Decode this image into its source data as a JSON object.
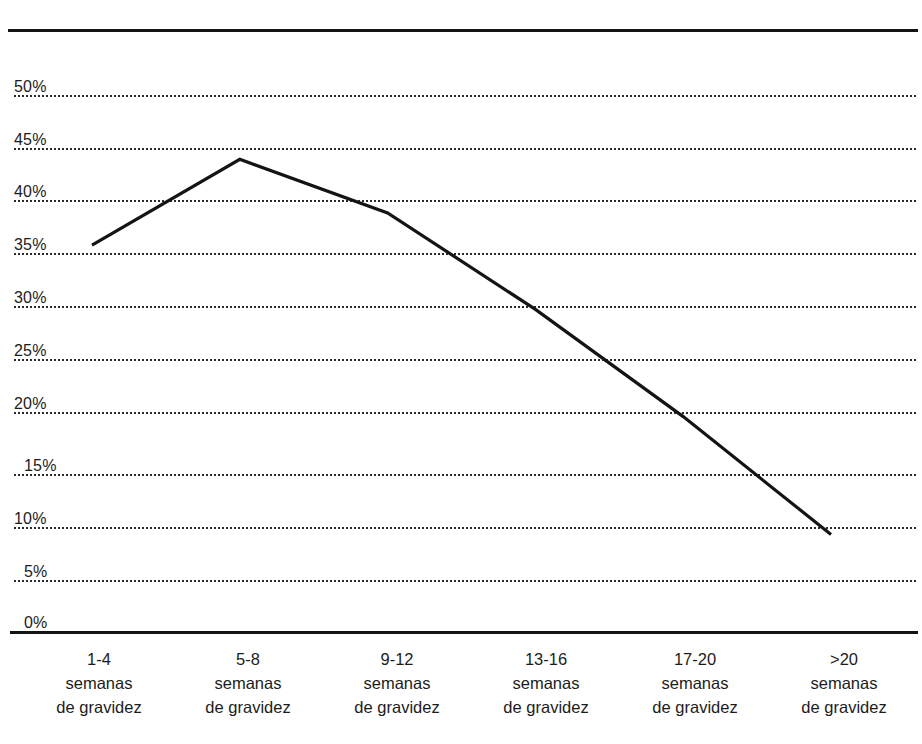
{
  "chart_data": {
    "type": "line",
    "title": "",
    "subtitle": "",
    "xlabel": "",
    "ylabel": "",
    "categories": [
      "1-4 semanas de gravidez",
      "5-8 semanas de gravidez",
      "9-12 semanas de gravidez",
      "13-16 semanas de gravidez",
      "17-20 semanas de gravidez",
      ">20 semanas de gravidez"
    ],
    "category_parts": [
      {
        "range": "1-4",
        "word1": "semanas",
        "word2": "de gravidez"
      },
      {
        "range": "5-8",
        "word1": "semanas",
        "word2": "de gravidez"
      },
      {
        "range": "9-12",
        "word1": "semanas",
        "word2": "de gravidez"
      },
      {
        "range": "13-16",
        "word1": "semanas",
        "word2": "de gravidez"
      },
      {
        "range": "17-20",
        "word1": "semanas",
        "word2": "de gravidez"
      },
      {
        "range": ">20",
        "word1": "semanas",
        "word2": "de gravidez"
      }
    ],
    "values": [
      36,
      44,
      39,
      30,
      20,
      9
    ],
    "value_labels": [
      "36%",
      "44%",
      "39%",
      "30%",
      "20%",
      "9%"
    ],
    "ylim": [
      0,
      50
    ],
    "ytick_values": [
      50,
      45,
      40,
      35,
      30,
      25,
      20,
      15,
      10,
      5,
      0
    ],
    "ytick_labels": [
      "50%",
      "45%",
      "40%",
      "35%",
      "30%",
      "25%",
      "20%",
      "15%",
      "10%",
      "5%",
      "0%"
    ],
    "grid": true,
    "grid_style": "dotted-horizontal",
    "legend": false,
    "legend_position": "none",
    "series": [
      {
        "name": "",
        "values": [
          36,
          44,
          39,
          30,
          20,
          9
        ]
      }
    ]
  },
  "style": {
    "line_color": "#141414",
    "grid_color": "#2a2a2a",
    "axis_color": "#141414",
    "text_color": "#1c1c1c",
    "background": "#ffffff"
  }
}
